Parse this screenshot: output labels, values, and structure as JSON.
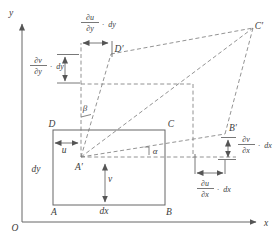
{
  "axes": {
    "y_label": "y",
    "x_label": "x",
    "origin": "O"
  },
  "rect_labels": {
    "A": "A",
    "B": "B",
    "C": "C",
    "D": "D",
    "dx": "dx",
    "dy": "dy"
  },
  "displacement": {
    "u": "u",
    "v": "v"
  },
  "deformed_labels": {
    "A_prime": "A′",
    "B_prime": "B′",
    "C_prime": "C′",
    "D_prime": "D′"
  },
  "angles": {
    "alpha": "α",
    "beta": "β"
  },
  "derivatives": {
    "du_dy": {
      "num": "∂u",
      "den": "∂y",
      "dot": "·",
      "factor": "dy"
    },
    "dv_dy": {
      "num": "∂v",
      "den": "∂y",
      "dot": "·",
      "factor": "dy"
    },
    "dv_dx": {
      "num": "∂v",
      "den": "∂x",
      "dot": "·",
      "factor": "dx"
    },
    "du_dx": {
      "num": "∂u",
      "den": "∂x",
      "dot": "·",
      "factor": "dx"
    }
  },
  "colors": {
    "line": "#666666",
    "text": "#3c3c3c",
    "background": "#ffffff"
  }
}
